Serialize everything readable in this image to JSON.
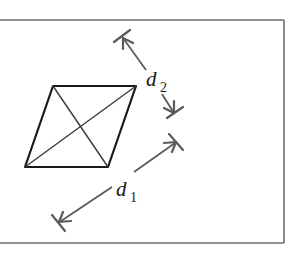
{
  "figure": {
    "colors": {
      "frame": "#6e6e6e",
      "rhombus": "#1a1a1a",
      "diagonals": "#3a3a3a",
      "dimension_arrows": "#5a5a5a",
      "background": "#ffffff"
    },
    "frame": {
      "top_y": 20,
      "bottom_y": 243,
      "right_x": 284,
      "left_open": true
    },
    "rhombus": {
      "vertices": {
        "top_left": [
          53,
          86
        ],
        "top_right": [
          136,
          86
        ],
        "bottom_right": [
          108,
          167
        ],
        "bottom_left": [
          25,
          167
        ]
      }
    },
    "labels": {
      "d1": {
        "main": "d",
        "subscript": "1"
      },
      "d2": {
        "main": "d",
        "subscript": "2"
      }
    },
    "dimension_arrows": {
      "d1": {
        "from": [
          59,
          222
        ],
        "to": [
          176,
          142
        ]
      },
      "d2": {
        "from": [
          122,
          36
        ],
        "to": [
          175,
          115
        ]
      }
    }
  }
}
